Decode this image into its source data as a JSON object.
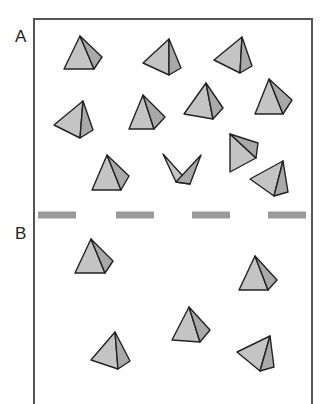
{
  "diagram": {
    "labels": {
      "a": "A",
      "b": "B"
    },
    "colors": {
      "frame": "#555555",
      "face_light": "#c4c4c4",
      "face_dark": "#a9a9a9",
      "edge": "#222222",
      "divider": "#9a9a9a"
    },
    "frame": {
      "left": 34,
      "top": 19,
      "right": 312,
      "bottom": 404
    },
    "divider": {
      "y": 215,
      "height": 7,
      "dashes": [
        [
          38,
          76
        ],
        [
          116,
          154
        ],
        [
          192,
          230
        ],
        [
          268,
          306
        ]
      ]
    },
    "regions": [
      {
        "name": "A",
        "pyramids": [
          {
            "apex": [
              80,
              36
            ],
            "left": [
              64,
              69
            ],
            "bottom": [
              94,
              69
            ],
            "right": [
              102,
              57
            ]
          },
          {
            "apex": [
              169,
              39
            ],
            "left": [
              143,
              63
            ],
            "bottom": [
              169,
              75
            ],
            "right": [
              181,
              68
            ]
          },
          {
            "apex": [
              242,
              37
            ],
            "left": [
              214,
              60
            ],
            "bottom": [
              240,
              73
            ],
            "right": [
              252,
              66
            ]
          },
          {
            "apex": [
              83,
              101
            ],
            "left": [
              54,
              125
            ],
            "bottom": [
              80,
              138
            ],
            "right": [
              93,
              130
            ]
          },
          {
            "apex": [
              143,
              95
            ],
            "left": [
              129,
              129
            ],
            "bottom": [
              154,
              129
            ],
            "right": [
              165,
              117
            ]
          },
          {
            "apex": [
              206,
              83
            ],
            "left": [
              184,
              114
            ],
            "bottom": [
              213,
              119
            ],
            "right": [
              223,
              108
            ]
          },
          {
            "apex": [
              269,
              79
            ],
            "left": [
              255,
              114
            ],
            "bottom": [
              283,
              114
            ],
            "right": [
              292,
              100
            ]
          },
          {
            "apex": [
              107,
              155
            ],
            "left": [
              92,
              190
            ],
            "bottom": [
              121,
              190
            ],
            "right": [
              129,
              176
            ]
          },
          {
            "apex": [
              190,
              184
            ],
            "left": [
              163,
              154
            ],
            "bottom": [
              176,
              182
            ],
            "right": [
              201,
              155
            ]
          },
          {
            "apex": [
              230,
              134
            ],
            "left": [
              230,
              172
            ],
            "bottom": [
              256,
              158
            ],
            "right": [
              258,
              143
            ]
          },
          {
            "apex": [
              283,
              161
            ],
            "left": [
              250,
              179
            ],
            "bottom": [
              274,
              196
            ],
            "right": [
              288,
              192
            ]
          }
        ]
      },
      {
        "name": "B",
        "pyramids": [
          {
            "apex": [
              91,
              239
            ],
            "left": [
              75,
              273
            ],
            "bottom": [
              105,
              273
            ],
            "right": [
              113,
              261
            ]
          },
          {
            "apex": [
              255,
              256
            ],
            "left": [
              239,
              290
            ],
            "bottom": [
              268,
              290
            ],
            "right": [
              277,
              280
            ]
          },
          {
            "apex": [
              189,
              307
            ],
            "left": [
              172,
              340
            ],
            "bottom": [
              200,
              342
            ],
            "right": [
              210,
              330
            ]
          },
          {
            "apex": [
              115,
              332
            ],
            "left": [
              91,
              360
            ],
            "bottom": [
              118,
              369
            ],
            "right": [
              130,
              361
            ]
          },
          {
            "apex": [
              270,
              336
            ],
            "left": [
              237,
              352
            ],
            "bottom": [
              260,
              371
            ],
            "right": [
              274,
              367
            ]
          }
        ]
      }
    ]
  }
}
